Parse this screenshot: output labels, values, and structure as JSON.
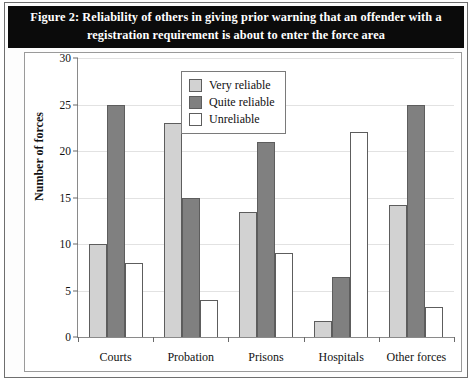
{
  "figure": {
    "title_line1": "Figure 2: Reliability of others in giving prior warning that an offender with a",
    "title_line2": "registration requirement is about to enter the force area"
  },
  "chart_data": {
    "type": "bar",
    "title": "Figure 2: Reliability of others in giving prior warning that an offender with a registration requirement is about to enter the force area",
    "xlabel": "",
    "ylabel": "Number of forces",
    "ylim": [
      0,
      30
    ],
    "yticks": [
      0,
      5,
      10,
      15,
      20,
      25,
      30
    ],
    "grid": true,
    "legend_position": "upper center",
    "categories": [
      "Courts",
      "Probation",
      "Prisons",
      "Hospitals",
      "Other forces"
    ],
    "series": [
      {
        "name": "Very reliable",
        "color": "#d2d2d2",
        "values": [
          10,
          23,
          13.4,
          1.7,
          14.2
        ]
      },
      {
        "name": "Quite reliable",
        "color": "#808080",
        "values": [
          25,
          15,
          21,
          6.5,
          25
        ]
      },
      {
        "name": "Unreliable",
        "color": "#ffffff",
        "values": [
          8,
          4,
          9,
          22,
          3.2
        ]
      }
    ]
  }
}
